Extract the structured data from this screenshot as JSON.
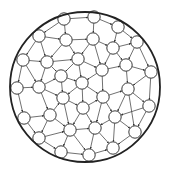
{
  "diagram": {
    "type": "circular-node-network",
    "boundary": {
      "cx": 85,
      "cy": 87,
      "r": 75,
      "stroke": "#222222",
      "stroke_width": 1.8
    },
    "node_style": {
      "r": 6.2,
      "fill": "#ffffff",
      "stroke": "#222222",
      "stroke_width": 0.9
    },
    "edge_style": {
      "stroke": "#333333",
      "stroke_width": 0.7,
      "arrowheads": true
    },
    "nodes": [
      {
        "id": 0,
        "x": 64,
        "y": 19
      },
      {
        "id": 1,
        "x": 94,
        "y": 17
      },
      {
        "id": 2,
        "x": 118,
        "y": 27
      },
      {
        "id": 3,
        "x": 39,
        "y": 36
      },
      {
        "id": 4,
        "x": 66,
        "y": 40
      },
      {
        "id": 5,
        "x": 93,
        "y": 39
      },
      {
        "id": 6,
        "x": 113,
        "y": 48
      },
      {
        "id": 7,
        "x": 137,
        "y": 42
      },
      {
        "id": 8,
        "x": 23,
        "y": 60
      },
      {
        "id": 9,
        "x": 47,
        "y": 62
      },
      {
        "id": 10,
        "x": 78,
        "y": 59
      },
      {
        "id": 11,
        "x": 102,
        "y": 70
      },
      {
        "id": 12,
        "x": 126,
        "y": 65
      },
      {
        "id": 13,
        "x": 151,
        "y": 72
      },
      {
        "id": 14,
        "x": 17,
        "y": 88
      },
      {
        "id": 15,
        "x": 39,
        "y": 87
      },
      {
        "id": 16,
        "x": 61,
        "y": 76
      },
      {
        "id": 17,
        "x": 82,
        "y": 83
      },
      {
        "id": 18,
        "x": 128,
        "y": 89
      },
      {
        "id": 19,
        "x": 63,
        "y": 98
      },
      {
        "id": 20,
        "x": 83,
        "y": 108
      },
      {
        "id": 21,
        "x": 103,
        "y": 97
      },
      {
        "id": 22,
        "x": 149,
        "y": 106
      },
      {
        "id": 23,
        "x": 24,
        "y": 118
      },
      {
        "id": 24,
        "x": 50,
        "y": 115
      },
      {
        "id": 25,
        "x": 115,
        "y": 117
      },
      {
        "id": 26,
        "x": 39,
        "y": 138
      },
      {
        "id": 27,
        "x": 70,
        "y": 130
      },
      {
        "id": 28,
        "x": 95,
        "y": 128
      },
      {
        "id": 29,
        "x": 135,
        "y": 132
      },
      {
        "id": 30,
        "x": 61,
        "y": 152
      },
      {
        "id": 31,
        "x": 89,
        "y": 155
      },
      {
        "id": 32,
        "x": 113,
        "y": 148
      }
    ],
    "edges": [
      [
        0,
        1
      ],
      [
        1,
        2
      ],
      [
        0,
        3
      ],
      [
        0,
        4
      ],
      [
        1,
        5
      ],
      [
        2,
        6
      ],
      [
        2,
        7
      ],
      [
        3,
        4
      ],
      [
        4,
        5
      ],
      [
        5,
        6
      ],
      [
        6,
        7
      ],
      [
        3,
        8
      ],
      [
        3,
        9
      ],
      [
        4,
        9
      ],
      [
        4,
        10
      ],
      [
        5,
        10
      ],
      [
        5,
        11
      ],
      [
        6,
        11
      ],
      [
        6,
        12
      ],
      [
        7,
        12
      ],
      [
        7,
        13
      ],
      [
        8,
        9
      ],
      [
        9,
        10
      ],
      [
        10,
        11
      ],
      [
        11,
        12
      ],
      [
        12,
        13
      ],
      [
        8,
        14
      ],
      [
        8,
        15
      ],
      [
        9,
        15
      ],
      [
        9,
        16
      ],
      [
        10,
        16
      ],
      [
        10,
        17
      ],
      [
        11,
        17
      ],
      [
        11,
        21
      ],
      [
        12,
        18
      ],
      [
        13,
        18
      ],
      [
        13,
        22
      ],
      [
        14,
        15
      ],
      [
        15,
        16
      ],
      [
        16,
        17
      ],
      [
        17,
        21
      ],
      [
        21,
        18
      ],
      [
        18,
        22
      ],
      [
        14,
        23
      ],
      [
        15,
        19
      ],
      [
        15,
        24
      ],
      [
        16,
        19
      ],
      [
        17,
        19
      ],
      [
        17,
        20
      ],
      [
        19,
        20
      ],
      [
        20,
        21
      ],
      [
        21,
        25
      ],
      [
        18,
        25
      ],
      [
        18,
        29
      ],
      [
        22,
        29
      ],
      [
        22,
        25
      ],
      [
        23,
        24
      ],
      [
        24,
        19
      ],
      [
        24,
        27
      ],
      [
        19,
        27
      ],
      [
        20,
        27
      ],
      [
        20,
        28
      ],
      [
        21,
        28
      ],
      [
        25,
        28
      ],
      [
        25,
        29
      ],
      [
        23,
        26
      ],
      [
        24,
        26
      ],
      [
        26,
        27
      ],
      [
        27,
        28
      ],
      [
        28,
        32
      ],
      [
        25,
        32
      ],
      [
        29,
        32
      ],
      [
        26,
        30
      ],
      [
        27,
        30
      ],
      [
        27,
        31
      ],
      [
        28,
        31
      ],
      [
        30,
        31
      ],
      [
        31,
        32
      ]
    ]
  }
}
